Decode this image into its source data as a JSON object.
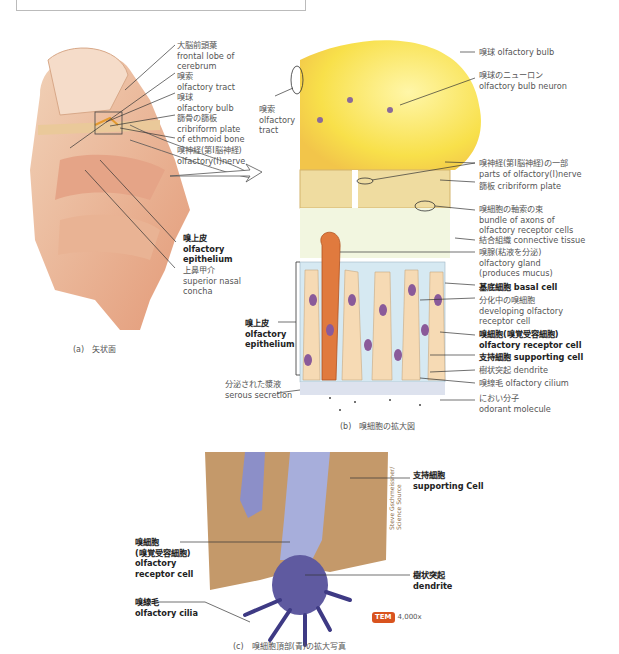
{
  "header": {
    "title_partial": "嗅上皮(嗅細胞・支持細胞・基底細胞)"
  },
  "panel_a": {
    "caption": "(a)　矢状面",
    "labels": [
      {
        "jp": "大脳前頭葉",
        "en": "frontal lobe of\ncerebrum"
      },
      {
        "jp": "嗅索",
        "en": "olfactory tract"
      },
      {
        "jp": "嗅球",
        "en": "olfactory bulb"
      },
      {
        "jp": "篩骨の篩板",
        "en": "cribriform plate\nof ethmoid bone"
      },
      {
        "jp": "嗅神経(第Ⅰ脳神経)",
        "en": "olfactory(Ⅰ)nerve"
      },
      {
        "jp": "嗅上皮",
        "en": "olfactory\nepithelium",
        "bold": true
      },
      {
        "jp": "上鼻甲介",
        "en": "superior nasal\nconcha"
      }
    ]
  },
  "panel_b": {
    "caption": "(b)　嗅細胞の拡大図",
    "left_labels": [
      {
        "jp": "嗅索",
        "en": "olfactory\ntract"
      },
      {
        "jp": "嗅上皮",
        "en": "olfactory\nepithelium",
        "bold": true
      },
      {
        "jp": "分泌された漿液",
        "en": "serous secretion"
      }
    ],
    "right_labels": [
      {
        "jp": "嗅球",
        "en": "olfactory bulb"
      },
      {
        "jp": "嗅球のニューロン",
        "en": "olfactory bulb neuron"
      },
      {
        "jp": "嗅神経(第Ⅰ脳神経)の一部",
        "en": "parts of olfactory(Ⅰ)nerve"
      },
      {
        "jp": "篩板",
        "en": "cribriform plate"
      },
      {
        "jp": "嗅細胞の軸索の束",
        "en": "bundle of axons of\nolfactory receptor cells"
      },
      {
        "jp": "結合組織",
        "en": "connective tissue"
      },
      {
        "jp": "嗅腺(粘液を分泌)",
        "en": "olfactory gland\n(produces mucus)"
      },
      {
        "jp": "基底細胞",
        "en": "basal cell",
        "bold": true
      },
      {
        "jp": "分化中の嗅細胞",
        "en": "developing olfactory\nreceptor cell"
      },
      {
        "jp": "嗅細胞(嗅覚受容細胞)",
        "en": "olfactory receptor cell",
        "bold": true
      },
      {
        "jp": "支持細胞",
        "en": "supporting cell",
        "bold": true
      },
      {
        "jp": "樹状突起",
        "en": "dendrite"
      },
      {
        "jp": "嗅線毛",
        "en": "olfactory cilium"
      },
      {
        "jp": "におい分子",
        "en": "odorant molecule"
      }
    ]
  },
  "panel_c": {
    "caption": "(c)　嗅細胞頂部(青)の拡大写真",
    "labels": [
      {
        "jp": "支持細胞",
        "en": "supporting Cell"
      },
      {
        "jp": "嗅細胞\n(嗅覚受容細胞)",
        "en": "olfactory\nreceptor cell"
      },
      {
        "jp": "樹状突起",
        "en": "dendrite"
      },
      {
        "jp": "嗅線毛",
        "en": "olfactory cilia"
      }
    ],
    "badge": "TEM",
    "magnification": "4,000x",
    "credit": "Steve Gschmeissner/\nScience Source"
  }
}
